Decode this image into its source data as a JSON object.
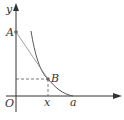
{
  "diagram": {
    "type": "coordinate-geometry",
    "axes": {
      "x_label": "",
      "y_label": "y",
      "origin_label": "O"
    },
    "points": [
      {
        "label": "A",
        "on": "y-axis"
      },
      {
        "label": "B",
        "on": "curve"
      }
    ],
    "tick_labels": {
      "x": "x",
      "a": "a"
    },
    "colors": {
      "axis": "#333333",
      "curve": "#555555",
      "line": "#777777",
      "dashed": "#555555"
    }
  }
}
